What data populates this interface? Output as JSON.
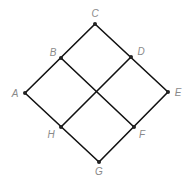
{
  "diagram": {
    "title": "",
    "vertices": [
      {
        "id": "A",
        "label": "A",
        "x": 25,
        "y": 93,
        "lx": 15,
        "ly": 94
      },
      {
        "id": "B",
        "label": "B",
        "x": 61,
        "y": 58,
        "lx": 53,
        "ly": 53
      },
      {
        "id": "C",
        "label": "C",
        "x": 95,
        "y": 24,
        "lx": 95,
        "ly": 14
      },
      {
        "id": "D",
        "label": "D",
        "x": 131,
        "y": 57,
        "lx": 141,
        "ly": 52
      },
      {
        "id": "E",
        "label": "E",
        "x": 168,
        "y": 92,
        "lx": 178,
        "ly": 93
      },
      {
        "id": "F",
        "label": "F",
        "x": 134,
        "y": 127,
        "lx": 142,
        "ly": 135
      },
      {
        "id": "G",
        "label": "G",
        "x": 99,
        "y": 162,
        "lx": 99,
        "ly": 172
      },
      {
        "id": "H",
        "label": "H",
        "x": 61,
        "y": 127,
        "lx": 51,
        "ly": 135
      }
    ],
    "edges": [
      [
        "A",
        "C"
      ],
      [
        "C",
        "E"
      ],
      [
        "E",
        "G"
      ],
      [
        "G",
        "A"
      ],
      [
        "B",
        "F"
      ],
      [
        "D",
        "H"
      ]
    ],
    "colors": {
      "edge": "#111111",
      "vertex": "#222222",
      "label": "#8a8a8a",
      "background": "#ffffff"
    }
  }
}
